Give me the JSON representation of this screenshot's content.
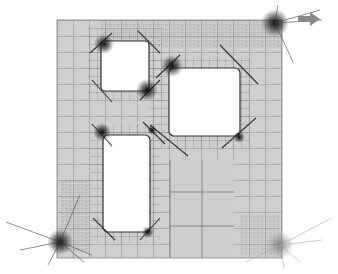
{
  "figure": {
    "type": "adaptive-quadtree-mesh",
    "background": "#ffffff",
    "domain_fill": "#cfcfcf",
    "hole_fill": "#ffffff",
    "grid_color": "#6e6e6e",
    "dense_color": "#1a1a1a",
    "arrow_color": "#8a8a8a",
    "domain": {
      "x": 57,
      "y": 20,
      "w": 225,
      "h": 238
    },
    "holes": [
      {
        "name": "upper-left-hole",
        "x": 101,
        "y": 41,
        "w": 48,
        "h": 50
      },
      {
        "name": "right-hole",
        "x": 169,
        "y": 68,
        "w": 71,
        "h": 68
      },
      {
        "name": "lower-left-hole",
        "x": 103,
        "y": 135,
        "w": 47,
        "h": 97
      }
    ],
    "singular_points": [
      {
        "name": "top-right-corner",
        "x": 278,
        "y": 22
      },
      {
        "name": "bottom-left-corner",
        "x": 60,
        "y": 242
      },
      {
        "name": "bottom-right-corner",
        "x": 278,
        "y": 246
      }
    ],
    "arrow": {
      "x1": 298,
      "y1": 19,
      "x2": 318,
      "y2": 19
    }
  }
}
